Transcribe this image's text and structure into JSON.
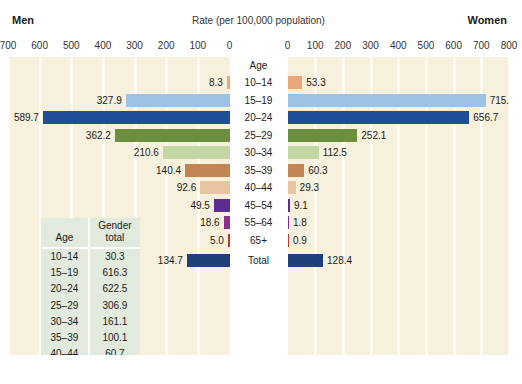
{
  "header": {
    "left_label": "Men",
    "right_label": "Women",
    "axis_title": "Rate (per 100,000 population)"
  },
  "axis": {
    "left_ticks": [
      "700",
      "600",
      "500",
      "400",
      "300",
      "200",
      "100",
      "0"
    ],
    "right_ticks": [
      "0",
      "100",
      "200",
      "300",
      "400",
      "500",
      "600",
      "700",
      "800"
    ]
  },
  "age_header": "Age",
  "gender_table": {
    "col1_header": "Age",
    "col2_header_line1": "Gender",
    "col2_header_line2": "total",
    "rows": [
      {
        "age": "10–14",
        "total": "30.3"
      },
      {
        "age": "15–19",
        "total": "616.3"
      },
      {
        "age": "20–24",
        "total": "622.5"
      },
      {
        "age": "25–29",
        "total": "306.9"
      },
      {
        "age": "30–34",
        "total": "161.1"
      },
      {
        "age": "35–39",
        "total": "100.1"
      },
      {
        "age": "40–44",
        "total": "60.7"
      },
      {
        "age": "45–54",
        "total": "28.9"
      },
      {
        "age": "55–64",
        "total": "9.8"
      },
      {
        "age": "65+",
        "total": "2.6"
      },
      {
        "age": "Total",
        "total": "131.4"
      }
    ]
  },
  "chart_data": {
    "type": "bar",
    "title": "Rate (per 100,000 population)",
    "subtype": "population-pyramid",
    "xlabel": "Rate (per 100,000 population)",
    "ylabel": "Age",
    "left_series_name": "Men",
    "right_series_name": "Women",
    "left_axis_range": [
      0,
      700
    ],
    "right_axis_range": [
      0,
      800
    ],
    "grid": true,
    "legend": "none",
    "categories": [
      "10–14",
      "15–19",
      "20–24",
      "25–29",
      "30–34",
      "35–39",
      "40–44",
      "45–54",
      "55–64",
      "65+",
      "Total"
    ],
    "men": [
      8.3,
      327.9,
      589.7,
      362.2,
      210.6,
      140.4,
      92.6,
      49.5,
      18.6,
      5.0,
      134.7
    ],
    "women": [
      53.3,
      715.6,
      656.7,
      252.1,
      112.5,
      60.3,
      29.3,
      9.1,
      1.8,
      0.9,
      128.4
    ],
    "men_labels": [
      "8.3",
      "327.9",
      "589.7",
      "362.2",
      "210.6",
      "140.4",
      "92.6",
      "49.5",
      "18.6",
      "5.0",
      "134.7"
    ],
    "women_labels": [
      "53.3",
      "715.6",
      "656.7",
      "252.1",
      "112.5",
      "60.3",
      "29.3",
      "9.1",
      "1.8",
      "0.9",
      "128.4"
    ],
    "gender_total": [
      30.3,
      616.3,
      622.5,
      306.9,
      161.1,
      100.1,
      60.7,
      28.9,
      9.8,
      2.6,
      131.4
    ],
    "colors": [
      "#e8a97a",
      "#9cc2e5",
      "#1f4e96",
      "#6b8f3e",
      "#c3d7a4",
      "#c08552",
      "#e8c4a0",
      "#5b2d8e",
      "#8b2f8b",
      "#c0392b",
      "#1f3f7a"
    ]
  },
  "colors": {
    "plot_background": "#f7f0dc",
    "gridline": "#fdfaf1",
    "table_background": "#e2eade",
    "age_column_background": "#ffffff"
  }
}
